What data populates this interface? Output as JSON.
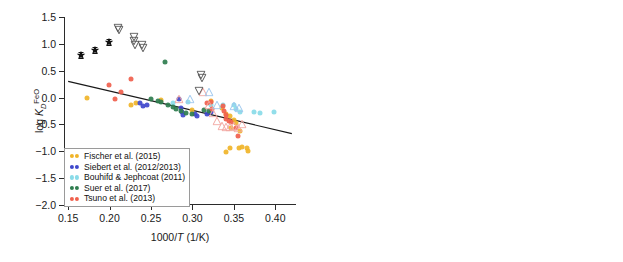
{
  "figure": {
    "panels": [
      {
        "id": "left",
        "xlabel": "1000/T (1/K)",
        "ylabel": "log K_D^FeO",
        "xticks": [
          "0.15",
          "0.20",
          "0.25",
          "0.30",
          "0.35",
          "0.40"
        ],
        "yticks": [
          "1.5",
          "1.0",
          "0.5",
          "0.0",
          "-0.5",
          "-1.0",
          "-1.5",
          "-2.0"
        ],
        "legend": [
          {
            "label": "Fischer et al. (2015)",
            "marker": "filled-circle",
            "color": "#f0b429"
          },
          {
            "label": "Siebert et al. (2012/2013)",
            "marker": "filled-circle",
            "color": "#3f48cc"
          },
          {
            "label": "Bouhifd & Jephcoat (2011)",
            "marker": "filled-circle",
            "color": "#89dbe8"
          },
          {
            "label": "Suer et al. (2017)",
            "marker": "filled-circle",
            "color": "#2f7d4f"
          },
          {
            "label": "Tsuno et al. (2013)",
            "marker": "filled-circle",
            "color": "#f0604d"
          }
        ]
      },
      {
        "id": "right",
        "xlabel": "P (GPa)",
        "ylabel": "log K_D^FeO",
        "xticks": [
          "0",
          "20",
          "40",
          "60",
          "80",
          "100",
          "120",
          "140"
        ],
        "yticks": [
          "1.5",
          "1.0",
          "0.5",
          "0.0",
          "-0.5",
          "-1.0",
          "-1.5",
          "-2.0"
        ],
        "legend": [
          {
            "label": "Chidester et al. 2017",
            "marker": "filled-circle",
            "color": "#f0604d"
          },
          {
            "label": "Ozawa et al. 2008",
            "marker": "open-triangle-up",
            "color": "#f2a6a0"
          },
          {
            "label": "Frost et al. 2010",
            "marker": "open-triangle-up",
            "color": "#9cc6ee"
          },
          {
            "label": "Davies et al. (2018)",
            "marker": "open-triangle-down",
            "color": "#555555"
          },
          {
            "label": "Pozzo et al. (2019)",
            "marker": "filled-star-errorbar",
            "color": "#111111"
          }
        ]
      }
    ]
  },
  "chart_data": [
    {
      "type": "scatter",
      "panel": "left",
      "title": "",
      "xlabel": "1000/T (1/K)",
      "ylabel": "log K_D^FeO",
      "xlim": [
        0.145,
        0.425
      ],
      "ylim": [
        -2.0,
        1.5
      ],
      "grid": false,
      "legend_position": "lower-left",
      "annotations": [
        "linear regression trend line"
      ],
      "trendline": {
        "x": [
          0.15,
          0.42
        ],
        "y": [
          0.3,
          -0.67
        ],
        "color": "#1a1a1a"
      },
      "series": [
        {
          "name": "Fischer et al. (2015)",
          "marker": "filled-circle",
          "color": "#f0b429",
          "points": [
            [
              0.173,
              0.0
            ],
            [
              0.226,
              -0.14
            ],
            [
              0.232,
              -0.1
            ],
            [
              0.262,
              -0.04
            ],
            [
              0.3,
              -0.23
            ],
            [
              0.322,
              -0.06
            ],
            [
              0.336,
              -0.19
            ],
            [
              0.341,
              -0.3
            ],
            [
              0.345,
              -0.35
            ],
            [
              0.35,
              -0.41
            ],
            [
              0.352,
              -0.47
            ],
            [
              0.347,
              -0.57
            ],
            [
              0.34,
              -1.02
            ],
            [
              0.345,
              -0.93
            ],
            [
              0.356,
              -0.93
            ],
            [
              0.36,
              -0.92
            ],
            [
              0.366,
              -0.94
            ],
            [
              0.367,
              -1.0
            ],
            [
              0.357,
              -0.62
            ]
          ]
        },
        {
          "name": "Siebert et al. (2012/2013)",
          "marker": "filled-circle",
          "color": "#3f48cc",
          "points": [
            [
              0.237,
              -0.1
            ],
            [
              0.24,
              -0.15
            ],
            [
              0.245,
              -0.13
            ],
            [
              0.284,
              -0.03
            ],
            [
              0.286,
              -0.2
            ],
            [
              0.287,
              -0.27
            ],
            [
              0.289,
              -0.33
            ],
            [
              0.303,
              -0.3
            ],
            [
              0.305,
              -0.35
            ],
            [
              0.318,
              -0.3
            ],
            [
              0.322,
              -0.27
            ]
          ]
        },
        {
          "name": "Bouhifd & Jephcoat (2011)",
          "marker": "filled-circle",
          "color": "#89dbe8",
          "points": [
            [
              0.277,
              -0.1
            ],
            [
              0.295,
              -0.08
            ],
            [
              0.323,
              -0.13
            ],
            [
              0.337,
              -0.14
            ],
            [
              0.35,
              -0.13
            ],
            [
              0.352,
              -0.22
            ],
            [
              0.358,
              -0.27
            ],
            [
              0.374,
              -0.26
            ],
            [
              0.382,
              -0.28
            ],
            [
              0.398,
              -0.27
            ]
          ]
        },
        {
          "name": "Suer et al. (2017)",
          "marker": "filled-circle",
          "color": "#2f7d4f",
          "points": [
            [
              0.25,
              -0.03
            ],
            [
              0.258,
              -0.06
            ],
            [
              0.262,
              -0.08
            ],
            [
              0.267,
              0.67
            ],
            [
              0.27,
              -0.13
            ],
            [
              0.276,
              -0.18
            ],
            [
              0.28,
              -0.22
            ],
            [
              0.286,
              -0.25
            ],
            [
              0.292,
              -0.28
            ],
            [
              0.3,
              -0.3
            ],
            [
              0.314,
              -0.24
            ],
            [
              0.32,
              -0.25
            ]
          ]
        },
        {
          "name": "Tsuno et al. (2013)",
          "marker": "filled-circle",
          "color": "#f0604d",
          "points": [
            [
              0.199,
              0.24
            ],
            [
              0.206,
              -0.03
            ],
            [
              0.226,
              0.35
            ],
            [
              0.214,
              0.1
            ],
            [
              0.318,
              -0.1
            ],
            [
              0.322,
              -0.08
            ],
            [
              0.324,
              -0.21
            ],
            [
              0.337,
              -0.16
            ],
            [
              0.338,
              -0.25
            ],
            [
              0.34,
              -0.33
            ],
            [
              0.341,
              -0.4
            ],
            [
              0.344,
              -0.43
            ],
            [
              0.347,
              -0.45
            ],
            [
              0.355,
              -0.72
            ],
            [
              0.352,
              -0.57
            ]
          ]
        },
        {
          "name": "Ozawa et al. 2008",
          "marker": "open-triangle-up",
          "color": "#f2a6a0",
          "points": [
            [
              0.284,
              -0.03
            ],
            [
              0.313,
              0.1
            ],
            [
              0.32,
              -0.14
            ],
            [
              0.325,
              -0.28
            ],
            [
              0.33,
              -0.43
            ],
            [
              0.336,
              -0.52
            ],
            [
              0.341,
              -0.55
            ],
            [
              0.345,
              -0.55
            ],
            [
              0.35,
              -0.53
            ],
            [
              0.355,
              -0.57
            ],
            [
              0.36,
              -0.5
            ]
          ]
        },
        {
          "name": "Frost et al. 2010",
          "marker": "open-triangle-up",
          "color": "#9cc6ee",
          "points": [
            [
              0.297,
              -0.02
            ],
            [
              0.32,
              0.1
            ],
            [
              0.33,
              -0.13
            ],
            [
              0.35,
              -0.16
            ],
            [
              0.356,
              -0.19
            ]
          ]
        },
        {
          "name": "Davies et al. (2018)",
          "marker": "open-triangle-down",
          "color": "#555555",
          "points": [
            [
              0.21,
              1.3
            ],
            [
              0.211,
              1.26
            ],
            [
              0.229,
              1.12
            ],
            [
              0.23,
              1.05
            ],
            [
              0.231,
              0.98
            ],
            [
              0.239,
              0.98
            ],
            [
              0.24,
              0.92
            ],
            [
              0.31,
              0.42
            ],
            [
              0.311,
              0.37
            ],
            [
              0.308,
              0.13
            ]
          ]
        },
        {
          "name": "Pozzo et al. (2019)",
          "marker": "filled-star-errorbar",
          "color": "#111111",
          "points": [
            [
              0.166,
              0.79
            ],
            [
              0.182,
              0.89
            ],
            [
              0.199,
              1.03
            ]
          ],
          "yerr": [
            0.06,
            0.06,
            0.06
          ]
        }
      ]
    },
    {
      "type": "scatter",
      "panel": "right",
      "title": "",
      "xlabel": "P (GPa)",
      "ylabel": "log K_D^FeO",
      "xlim": [
        0,
        145
      ],
      "ylim": [
        -2.0,
        1.5
      ],
      "grid": false,
      "legend_position": "lower-center",
      "series": [
        {
          "name": "Fischer et al. (2015)",
          "marker": "filled-circle",
          "color": "#f0b429",
          "points": [
            [
              14,
              -0.28
            ],
            [
              15,
              -0.92
            ],
            [
              15,
              -0.98
            ],
            [
              16,
              -1.0
            ],
            [
              20,
              -0.96
            ],
            [
              25,
              -0.9
            ],
            [
              25,
              -0.98
            ],
            [
              25,
              -1.02
            ],
            [
              25,
              -0.55
            ],
            [
              25,
              -0.72
            ],
            [
              36,
              -0.25
            ],
            [
              47,
              -0.13
            ],
            [
              55,
              -0.09
            ],
            [
              57,
              0.02
            ],
            [
              59,
              -0.06
            ],
            [
              68,
              -0.02
            ],
            [
              99,
              0.0
            ]
          ]
        },
        {
          "name": "Siebert et al. (2012/2013)",
          "marker": "filled-circle",
          "color": "#3f48cc",
          "points": [
            [
              38,
              -0.35
            ],
            [
              45,
              -0.3
            ],
            [
              50,
              -0.1
            ],
            [
              53,
              -0.12
            ],
            [
              59,
              -0.22
            ],
            [
              62,
              -0.16
            ],
            [
              65,
              -0.28
            ],
            [
              73,
              -0.1
            ]
          ]
        },
        {
          "name": "Bouhifd & Jephcoat (2011)",
          "marker": "filled-circle",
          "color": "#89dbe8",
          "points": [
            [
              15,
              -0.58
            ],
            [
              30,
              -0.18
            ],
            [
              35,
              -0.22
            ],
            [
              42,
              -0.12
            ],
            [
              47,
              -0.1
            ],
            [
              50,
              -0.18
            ]
          ]
        },
        {
          "name": "Suer et al. (2017)",
          "marker": "filled-circle",
          "color": "#2f7d4f",
          "points": [
            [
              48,
              -0.13
            ],
            [
              54,
              -0.2
            ],
            [
              58,
              -0.3
            ],
            [
              60,
              -0.35
            ],
            [
              64,
              -0.26
            ],
            [
              66,
              -0.14
            ],
            [
              74,
              0.67
            ],
            [
              84,
              -0.05
            ],
            [
              92,
              -0.02
            ]
          ]
        },
        {
          "name": "Chidester et al. 2017",
          "marker": "filled-circle",
          "color": "#f0604d",
          "points": [
            [
              25,
              -0.2
            ],
            [
              25,
              -0.26
            ],
            [
              25,
              -0.33
            ],
            [
              25,
              -0.4
            ],
            [
              25,
              -0.46
            ],
            [
              25,
              -0.6
            ],
            [
              25,
              -0.75
            ],
            [
              54,
              0.35
            ],
            [
              60,
              0.24
            ],
            [
              72,
              -0.5
            ]
          ]
        },
        {
          "name": "Ozawa et al. 2008",
          "marker": "open-triangle-up",
          "color": "#f2a6a0",
          "points": [
            [
              16,
              -0.35
            ],
            [
              33,
              -0.52
            ],
            [
              39,
              -0.6
            ],
            [
              70,
              0.07
            ],
            [
              73,
              -0.55
            ],
            [
              93,
              -0.52
            ],
            [
              123,
              -0.38
            ],
            [
              134,
              -0.14
            ]
          ]
        },
        {
          "name": "Frost et al. 2010",
          "marker": "open-triangle-up",
          "color": "#9cc6ee",
          "points": [
            [
              31,
              -0.16
            ],
            [
              34,
              -0.15
            ],
            [
              68,
              0.08
            ],
            [
              71,
              0.0
            ],
            [
              72,
              -0.08
            ]
          ]
        },
        {
          "name": "Davies et al. (2018)",
          "marker": "open-triangle-down",
          "color": "#555555",
          "points": [
            [
              134,
              1.3
            ],
            [
              134,
              1.22
            ],
            [
              134,
              1.12
            ],
            [
              134,
              1.05
            ],
            [
              134,
              0.98
            ],
            [
              134,
              0.92
            ],
            [
              132,
              0.42
            ],
            [
              132,
              0.2
            ]
          ]
        },
        {
          "name": "Pozzo et al. (2019)",
          "marker": "filled-star-errorbar",
          "color": "#111111",
          "points": [
            [
              123,
              1.03
            ],
            [
              123,
              0.92
            ],
            [
              123,
              0.86
            ]
          ],
          "yerr": [
            0.07,
            0.05,
            0.05
          ]
        }
      ]
    }
  ]
}
